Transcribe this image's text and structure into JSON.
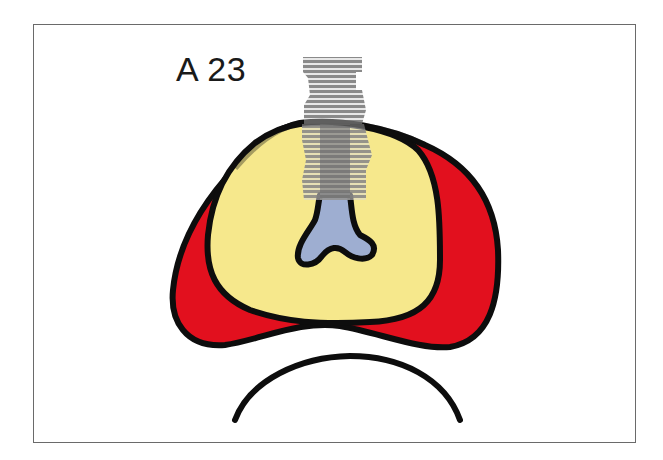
{
  "figure": {
    "label": "A 23"
  },
  "colors": {
    "outline": "#0d0d0d",
    "bone_yellow": "#f6e88c",
    "graft_red": "#e2101e",
    "canal_blue": "#9eaed1",
    "implant_gray": "#8a8a8a",
    "frame": "#6a6a6a"
  },
  "regions": [
    {
      "name": "outer-ridge-red",
      "color": "graft_red"
    },
    {
      "name": "inner-bone-yellow",
      "color": "bone_yellow"
    },
    {
      "name": "canal-blue",
      "color": "canal_blue"
    },
    {
      "name": "implant-gray",
      "color": "implant_gray"
    },
    {
      "name": "lower-arc"
    }
  ]
}
